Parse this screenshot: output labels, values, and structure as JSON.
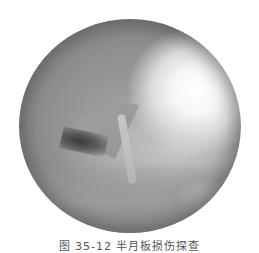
{
  "image": {
    "description": "Grayscale arthroscopic view inside circular scope field",
    "colors": {
      "background": "#ffffff",
      "highlight": "#ffffff",
      "tissue_mid": "#9a9a9a",
      "edge_shadow": "#6e6e6e",
      "cleft": "#3a3a3a"
    }
  },
  "caption": {
    "text": "图 35-12  半月板损伤探查"
  }
}
